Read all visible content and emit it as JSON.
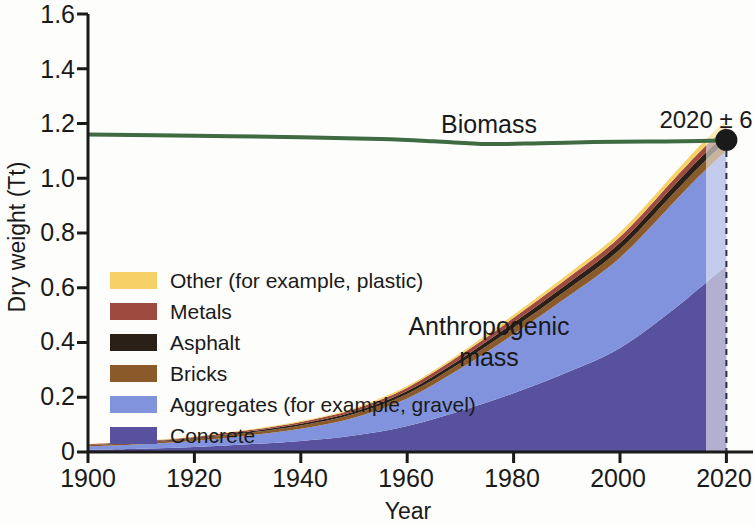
{
  "chart_data": {
    "type": "area",
    "title": "",
    "xlabel": "Year",
    "ylabel": "Dry weight (Tt)",
    "xlim": [
      1900,
      2025
    ],
    "ylim": [
      0,
      1.6
    ],
    "xticks": [
      1900,
      1920,
      1940,
      1960,
      1980,
      2000,
      2020
    ],
    "yticks": [
      "0",
      "0.2",
      "0.4",
      "0.6",
      "0.8",
      "1.0",
      "1.2",
      "1.4",
      "1.6"
    ],
    "grid": false,
    "legend_position": "inside-lower-left",
    "stacked_order_bottom_to_top": [
      "Concrete",
      "Aggregates (for example, gravel)",
      "Bricks",
      "Asphalt",
      "Metals",
      "Other (for example, plastic)"
    ],
    "x": [
      1900,
      1910,
      1920,
      1930,
      1940,
      1950,
      1960,
      1970,
      1980,
      1990,
      2000,
      2010,
      2015,
      2020
    ],
    "series": [
      {
        "name": "Concrete",
        "color": "#58519e",
        "values": [
          0.008,
          0.012,
          0.018,
          0.028,
          0.04,
          0.06,
          0.095,
          0.15,
          0.215,
          0.29,
          0.38,
          0.52,
          0.6,
          0.68
        ]
      },
      {
        "name": "Aggregates (for example, gravel)",
        "color": "#8193dd",
        "values": [
          0.012,
          0.016,
          0.022,
          0.032,
          0.045,
          0.065,
          0.1,
          0.155,
          0.215,
          0.275,
          0.33,
          0.39,
          0.41,
          0.42
        ]
      },
      {
        "name": "Bricks",
        "color": "#8a5a2b",
        "values": [
          0.005,
          0.006,
          0.008,
          0.01,
          0.012,
          0.014,
          0.017,
          0.02,
          0.024,
          0.027,
          0.03,
          0.033,
          0.034,
          0.035
        ]
      },
      {
        "name": "Asphalt",
        "color": "#2a2018",
        "values": [
          0.001,
          0.002,
          0.003,
          0.004,
          0.006,
          0.008,
          0.011,
          0.014,
          0.018,
          0.021,
          0.024,
          0.027,
          0.028,
          0.029
        ]
      },
      {
        "name": "Metals",
        "color": "#9e4a3e",
        "values": [
          0.002,
          0.003,
          0.004,
          0.005,
          0.007,
          0.009,
          0.012,
          0.015,
          0.018,
          0.02,
          0.022,
          0.024,
          0.025,
          0.026
        ]
      },
      {
        "name": "Other (for example, plastic)",
        "color": "#f5d168",
        "values": [
          0.001,
          0.001,
          0.002,
          0.002,
          0.003,
          0.004,
          0.006,
          0.008,
          0.011,
          0.014,
          0.017,
          0.02,
          0.022,
          0.024
        ]
      }
    ],
    "biomass_line": {
      "name": "Biomass",
      "color": "#3f6b42",
      "x": [
        1900,
        1920,
        1940,
        1955,
        1965,
        1975,
        1985,
        1995,
        2005,
        2015,
        2020
      ],
      "values": [
        1.16,
        1.155,
        1.15,
        1.143,
        1.135,
        1.125,
        1.128,
        1.132,
        1.134,
        1.136,
        1.138
      ]
    },
    "annotations": [
      {
        "name": "crossing-point",
        "text": "2020 ± 6",
        "x": 2020,
        "y": 1.14
      }
    ],
    "series_labels": [
      {
        "name": "biomass-label",
        "text": "Biomass"
      },
      {
        "name": "anthropogenic-label-line1",
        "text": "Anthropogenic"
      },
      {
        "name": "anthropogenic-label-line2",
        "text": "mass"
      }
    ],
    "projection": {
      "start_year": 2017,
      "marker_year": 2020,
      "style": "faded-with-dashed-line"
    }
  },
  "legend": {
    "items": [
      {
        "label": "Other (for example, plastic)",
        "color": "#f5d168"
      },
      {
        "label": "Metals",
        "color": "#9e4a3e"
      },
      {
        "label": "Asphalt",
        "color": "#2a2018"
      },
      {
        "label": "Bricks",
        "color": "#8a5a2b"
      },
      {
        "label": "Aggregates (for example, gravel)",
        "color": "#8193dd"
      },
      {
        "label": "Concrete",
        "color": "#58519e"
      }
    ]
  },
  "axes": {
    "y_title": "Dry weight (Tt)",
    "x_title": "Year",
    "y_ticks": [
      "1.6",
      "1.4",
      "1.2",
      "1.0",
      "0.8",
      "0.6",
      "0.4",
      "0.2",
      "0"
    ],
    "x_ticks": [
      "1900",
      "1920",
      "1940",
      "1960",
      "1980",
      "2000",
      "2020"
    ]
  }
}
